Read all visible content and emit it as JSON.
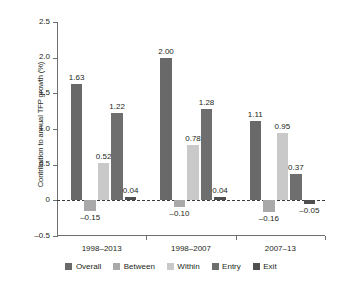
{
  "chart_data": {
    "type": "bar",
    "title": "",
    "subtitle": "",
    "xlabel": "",
    "ylabel": "Contribution to annual TFP growth (%)",
    "ylim": [
      -0.5,
      2.5
    ],
    "yticks": [
      "-0.5",
      "0",
      "0.5",
      "1.0",
      "1.5",
      "2.0",
      "2.5"
    ],
    "ytick_values": [
      -0.5,
      0,
      0.5,
      1.0,
      1.5,
      2.0,
      2.5
    ],
    "grid": false,
    "legend_position": "bottom",
    "zero_line": true,
    "categories": [
      "1998–2013",
      "1998–2007",
      "2007–13"
    ],
    "series": [
      {
        "name": "Overall",
        "color": "#696969",
        "values": [
          1.63,
          2.0,
          1.11
        ],
        "labels": [
          "1.63",
          "2.00",
          "1.11"
        ]
      },
      {
        "name": "Between",
        "color": "#a9a9a9",
        "values": [
          -0.15,
          -0.1,
          -0.16
        ],
        "labels": [
          "–0.15",
          "–0.10",
          "–0.16"
        ]
      },
      {
        "name": "Within",
        "color": "#c9c9c9",
        "values": [
          0.52,
          0.78,
          0.95
        ],
        "labels": [
          "0.52",
          "0.78",
          "0.95"
        ]
      },
      {
        "name": "Entry",
        "color": "#6e6e6e",
        "values": [
          1.22,
          1.28,
          0.37
        ],
        "labels": [
          "1.22",
          "1.28",
          "0.37"
        ]
      },
      {
        "name": "Exit",
        "color": "#4f4f4f",
        "values": [
          0.04,
          0.04,
          -0.05
        ],
        "labels": [
          "0.04",
          "0.04",
          "–0.05"
        ]
      }
    ]
  },
  "legend": {
    "items": [
      {
        "label": "Overall",
        "color": "#696969"
      },
      {
        "label": "Between",
        "color": "#a9a9a9"
      },
      {
        "label": "Within",
        "color": "#c9c9c9"
      },
      {
        "label": "Entry",
        "color": "#6e6e6e"
      },
      {
        "label": "Exit",
        "color": "#4f4f4f"
      }
    ]
  }
}
